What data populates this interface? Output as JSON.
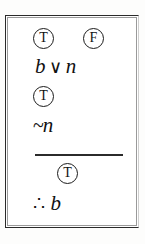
{
  "figure": {
    "type": "logic-proof",
    "argument_form": "disjunctive-syllogism",
    "border_color": "#2a2a2a",
    "text_color": "#111111"
  },
  "proof": {
    "truth_row_1": [
      {
        "label": "T",
        "name": "truth-value-true"
      },
      {
        "label": "F",
        "name": "truth-value-false"
      }
    ],
    "premise_1": {
      "left_operand": "b",
      "operator": "∨",
      "right_operand": "n"
    },
    "truth_row_2": [
      {
        "label": "T",
        "name": "truth-value-true"
      }
    ],
    "premise_2": {
      "negation": "~",
      "operand": "n"
    },
    "truth_row_3": [
      {
        "label": "T",
        "name": "truth-value-true"
      }
    ],
    "conclusion": {
      "therefore": "∴",
      "operand": "b"
    }
  }
}
